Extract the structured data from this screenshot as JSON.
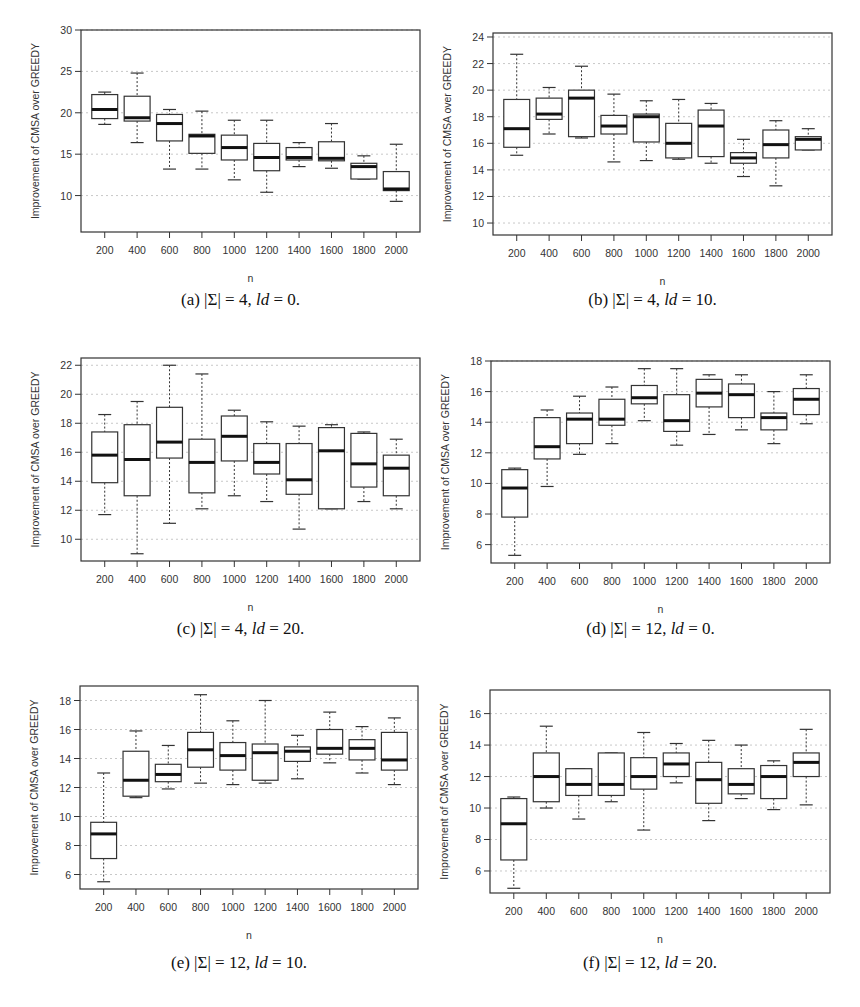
{
  "figure": {
    "panels": [
      {
        "id": "a",
        "caption_prefix": "(a) |Σ| = 4, ",
        "caption_ld": "ld",
        "caption_suffix": " = 0."
      },
      {
        "id": "b",
        "caption_prefix": "(b) |Σ| = 4, ",
        "caption_ld": "ld",
        "caption_suffix": " = 10."
      },
      {
        "id": "c",
        "caption_prefix": "(c) |Σ| = 4, ",
        "caption_ld": "ld",
        "caption_suffix": " = 20."
      },
      {
        "id": "d",
        "caption_prefix": "(d) |Σ| = 12, ",
        "caption_ld": "ld",
        "caption_suffix": " = 0."
      },
      {
        "id": "e",
        "caption_prefix": "(e) |Σ| = 12, ",
        "caption_ld": "ld",
        "caption_suffix": " = 10."
      },
      {
        "id": "f",
        "caption_prefix": "(f) |Σ| = 12, ",
        "caption_ld": "ld",
        "caption_suffix": " = 20."
      }
    ]
  },
  "chart_data": [
    {
      "type": "boxplot",
      "title": "(a) |Σ| = 4, ld = 0.",
      "xlabel": "n",
      "ylabel": "Improvement of CMSA over GREEDY",
      "categories": [
        "200",
        "400",
        "600",
        "800",
        "1000",
        "1200",
        "1400",
        "1600",
        "1800",
        "2000"
      ],
      "ylim": [
        5.6,
        30
      ],
      "yticks": [
        10,
        15,
        20,
        25,
        30
      ],
      "grid": true,
      "boxes": [
        {
          "min": 18.6,
          "q1": 19.3,
          "median": 20.4,
          "q3": 22.2,
          "max": 22.5
        },
        {
          "min": 16.4,
          "q1": 19.0,
          "median": 19.4,
          "q3": 22.0,
          "max": 24.8
        },
        {
          "min": 13.2,
          "q1": 16.6,
          "median": 18.7,
          "q3": 19.8,
          "max": 20.4
        },
        {
          "min": 13.2,
          "q1": 15.1,
          "median": 17.2,
          "q3": 17.4,
          "max": 20.2
        },
        {
          "min": 11.9,
          "q1": 14.3,
          "median": 15.8,
          "q3": 17.3,
          "max": 19.1
        },
        {
          "min": 10.4,
          "q1": 13.0,
          "median": 14.6,
          "q3": 16.3,
          "max": 19.1
        },
        {
          "min": 13.5,
          "q1": 14.3,
          "median": 14.6,
          "q3": 15.8,
          "max": 16.4
        },
        {
          "min": 13.3,
          "q1": 14.2,
          "median": 14.5,
          "q3": 16.5,
          "max": 18.7
        },
        {
          "min": 12.0,
          "q1": 12.0,
          "median": 13.5,
          "q3": 13.9,
          "max": 14.8
        },
        {
          "min": 9.3,
          "q1": 10.6,
          "median": 10.8,
          "q3": 12.9,
          "max": 16.2
        }
      ]
    },
    {
      "type": "boxplot",
      "title": "(b) |Σ| = 4, ld = 10.",
      "xlabel": "n",
      "ylabel": "Improvement of CMSA over GREEDY",
      "categories": [
        "200",
        "400",
        "600",
        "800",
        "1000",
        "1200",
        "1400",
        "1600",
        "1800",
        "2000"
      ],
      "ylim": [
        9.1,
        24.3
      ],
      "yticks": [
        10,
        12,
        14,
        16,
        18,
        20,
        22,
        24
      ],
      "grid": true,
      "boxes": [
        {
          "min": 15.1,
          "q1": 15.7,
          "median": 17.1,
          "q3": 19.3,
          "max": 22.7
        },
        {
          "min": 16.7,
          "q1": 17.8,
          "median": 18.2,
          "q3": 19.4,
          "max": 20.2
        },
        {
          "min": 16.4,
          "q1": 16.5,
          "median": 19.4,
          "q3": 20.0,
          "max": 21.8
        },
        {
          "min": 14.6,
          "q1": 16.7,
          "median": 17.3,
          "q3": 18.1,
          "max": 19.7
        },
        {
          "min": 14.7,
          "q1": 16.1,
          "median": 18.0,
          "q3": 18.2,
          "max": 19.2
        },
        {
          "min": 14.8,
          "q1": 14.9,
          "median": 16.0,
          "q3": 17.5,
          "max": 19.3
        },
        {
          "min": 14.5,
          "q1": 15.0,
          "median": 17.3,
          "q3": 18.5,
          "max": 19.0
        },
        {
          "min": 13.5,
          "q1": 14.5,
          "median": 14.9,
          "q3": 15.3,
          "max": 16.3
        },
        {
          "min": 12.8,
          "q1": 14.9,
          "median": 15.9,
          "q3": 17.0,
          "max": 17.7
        },
        {
          "min": 15.5,
          "q1": 15.5,
          "median": 16.3,
          "q3": 16.5,
          "max": 17.1
        }
      ]
    },
    {
      "type": "boxplot",
      "title": "(c) |Σ| = 4, ld = 20.",
      "xlabel": "n",
      "ylabel": "Improvement of CMSA over GREEDY",
      "categories": [
        "200",
        "400",
        "600",
        "800",
        "1000",
        "1200",
        "1400",
        "1600",
        "1800",
        "2000"
      ],
      "ylim": [
        8.5,
        22.5
      ],
      "yticks": [
        10,
        12,
        14,
        16,
        18,
        20,
        22
      ],
      "grid": true,
      "boxes": [
        {
          "min": 11.7,
          "q1": 13.9,
          "median": 15.8,
          "q3": 17.4,
          "max": 18.6
        },
        {
          "min": 9.0,
          "q1": 13.0,
          "median": 15.5,
          "q3": 17.9,
          "max": 19.5
        },
        {
          "min": 11.1,
          "q1": 15.6,
          "median": 16.7,
          "q3": 19.1,
          "max": 22.0
        },
        {
          "min": 12.1,
          "q1": 13.2,
          "median": 15.3,
          "q3": 16.9,
          "max": 21.4
        },
        {
          "min": 13.0,
          "q1": 15.4,
          "median": 17.1,
          "q3": 18.5,
          "max": 18.9
        },
        {
          "min": 12.6,
          "q1": 14.5,
          "median": 15.3,
          "q3": 16.6,
          "max": 18.1
        },
        {
          "min": 10.7,
          "q1": 13.1,
          "median": 14.1,
          "q3": 16.6,
          "max": 17.8
        },
        {
          "min": 12.1,
          "q1": 12.1,
          "median": 16.1,
          "q3": 17.7,
          "max": 17.9
        },
        {
          "min": 12.6,
          "q1": 13.6,
          "median": 15.2,
          "q3": 17.3,
          "max": 17.4
        },
        {
          "min": 12.1,
          "q1": 13.0,
          "median": 14.9,
          "q3": 15.8,
          "max": 16.9
        }
      ]
    },
    {
      "type": "boxplot",
      "title": "(d) |Σ| = 12, ld = 0.",
      "xlabel": "n",
      "ylabel": "Improvement of CMSA over GREEDY",
      "categories": [
        "200",
        "400",
        "600",
        "800",
        "1000",
        "1200",
        "1400",
        "1600",
        "1800",
        "2000"
      ],
      "ylim": [
        4.8,
        18
      ],
      "yticks": [
        6,
        8,
        10,
        12,
        14,
        16,
        18
      ],
      "grid": true,
      "boxes": [
        {
          "min": 5.3,
          "q1": 7.8,
          "median": 9.7,
          "q3": 10.9,
          "max": 11.0
        },
        {
          "min": 9.8,
          "q1": 11.6,
          "median": 12.4,
          "q3": 14.3,
          "max": 14.8
        },
        {
          "min": 11.9,
          "q1": 12.6,
          "median": 14.2,
          "q3": 14.6,
          "max": 15.7
        },
        {
          "min": 12.6,
          "q1": 13.8,
          "median": 14.2,
          "q3": 15.5,
          "max": 16.3
        },
        {
          "min": 14.1,
          "q1": 15.2,
          "median": 15.6,
          "q3": 16.4,
          "max": 17.5
        },
        {
          "min": 12.5,
          "q1": 13.4,
          "median": 14.1,
          "q3": 15.8,
          "max": 17.5
        },
        {
          "min": 13.2,
          "q1": 15.0,
          "median": 15.9,
          "q3": 16.8,
          "max": 17.1
        },
        {
          "min": 13.5,
          "q1": 14.3,
          "median": 15.8,
          "q3": 16.5,
          "max": 17.1
        },
        {
          "min": 12.6,
          "q1": 13.5,
          "median": 14.3,
          "q3": 14.6,
          "max": 16.0
        },
        {
          "min": 13.9,
          "q1": 14.5,
          "median": 15.5,
          "q3": 16.2,
          "max": 17.1
        }
      ]
    },
    {
      "type": "boxplot",
      "title": "(e) |Σ| = 12, ld = 10.",
      "xlabel": "n",
      "ylabel": "Improvement of CMSA over GREEDY",
      "categories": [
        "200",
        "400",
        "600",
        "800",
        "1000",
        "1200",
        "1400",
        "1600",
        "1800",
        "2000"
      ],
      "ylim": [
        5.0,
        19.0
      ],
      "yticks": [
        6,
        8,
        10,
        12,
        14,
        16,
        18
      ],
      "grid": true,
      "boxes": [
        {
          "min": 5.5,
          "q1": 7.1,
          "median": 8.8,
          "q3": 9.6,
          "max": 13.0
        },
        {
          "min": 11.3,
          "q1": 11.4,
          "median": 12.5,
          "q3": 14.5,
          "max": 15.9
        },
        {
          "min": 11.9,
          "q1": 12.4,
          "median": 12.9,
          "q3": 13.6,
          "max": 14.9
        },
        {
          "min": 12.3,
          "q1": 13.4,
          "median": 14.6,
          "q3": 15.8,
          "max": 18.4
        },
        {
          "min": 12.2,
          "q1": 13.2,
          "median": 14.2,
          "q3": 15.1,
          "max": 16.6
        },
        {
          "min": 12.3,
          "q1": 12.5,
          "median": 14.4,
          "q3": 15.0,
          "max": 18.0
        },
        {
          "min": 12.6,
          "q1": 13.8,
          "median": 14.5,
          "q3": 14.8,
          "max": 15.6
        },
        {
          "min": 13.7,
          "q1": 14.3,
          "median": 14.7,
          "q3": 16.0,
          "max": 17.2
        },
        {
          "min": 13.0,
          "q1": 13.9,
          "median": 14.7,
          "q3": 15.3,
          "max": 16.2
        },
        {
          "min": 12.2,
          "q1": 13.2,
          "median": 13.9,
          "q3": 15.8,
          "max": 16.8
        }
      ]
    },
    {
      "type": "boxplot",
      "title": "(f) |Σ| = 12, ld = 20.",
      "xlabel": "n",
      "ylabel": "Improvement of CMSA over GREEDY",
      "categories": [
        "200",
        "400",
        "600",
        "800",
        "1000",
        "1200",
        "1400",
        "1600",
        "1800",
        "2000"
      ],
      "ylim": [
        4.6,
        17.5
      ],
      "yticks": [
        6,
        8,
        10,
        12,
        14,
        16
      ],
      "grid": true,
      "boxes": [
        {
          "min": 4.9,
          "q1": 6.7,
          "median": 9.0,
          "q3": 10.6,
          "max": 10.7
        },
        {
          "min": 10.0,
          "q1": 10.4,
          "median": 12.0,
          "q3": 13.5,
          "max": 15.2
        },
        {
          "min": 9.3,
          "q1": 10.8,
          "median": 11.5,
          "q3": 12.5,
          "max": 12.5
        },
        {
          "min": 10.4,
          "q1": 10.8,
          "median": 11.5,
          "q3": 13.5,
          "max": 13.5
        },
        {
          "min": 8.6,
          "q1": 11.2,
          "median": 12.0,
          "q3": 13.2,
          "max": 14.8
        },
        {
          "min": 11.6,
          "q1": 12.0,
          "median": 12.8,
          "q3": 13.5,
          "max": 14.1
        },
        {
          "min": 9.2,
          "q1": 10.3,
          "median": 11.8,
          "q3": 12.9,
          "max": 14.3
        },
        {
          "min": 10.6,
          "q1": 10.9,
          "median": 11.5,
          "q3": 12.5,
          "max": 14.0
        },
        {
          "min": 9.9,
          "q1": 10.6,
          "median": 12.0,
          "q3": 12.7,
          "max": 13.0
        },
        {
          "min": 10.2,
          "q1": 12.0,
          "median": 12.9,
          "q3": 13.5,
          "max": 15.0
        }
      ]
    }
  ]
}
